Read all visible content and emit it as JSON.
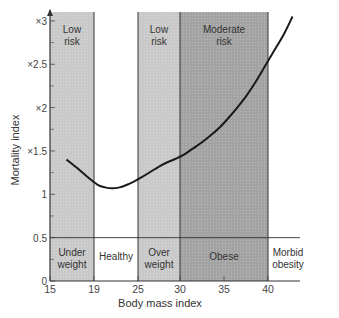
{
  "chart_data": {
    "type": "line",
    "title": "",
    "xlabel": "Body mass index",
    "ylabel": "Mortality index",
    "xlim": [
      15,
      43
    ],
    "ylim": [
      0,
      3.1
    ],
    "x_ticks": [
      15,
      19,
      25,
      30,
      35,
      40
    ],
    "y_ticks": [
      {
        "value": 0,
        "label": "0"
      },
      {
        "value": 0.5,
        "label": "0.5"
      },
      {
        "value": 1,
        "label": "1"
      },
      {
        "value": 1.5,
        "label": "×1.5"
      },
      {
        "value": 2,
        "label": "×2"
      },
      {
        "value": 2.5,
        "label": "×2.5"
      },
      {
        "value": 3,
        "label": "×3"
      }
    ],
    "grid": false,
    "series": [
      {
        "name": "Mortality index",
        "x": [
          16.5,
          17.5,
          18.5,
          19.5,
          20.5,
          21.5,
          22.5,
          23.5,
          24.5,
          25.5,
          26.5,
          27.5,
          28.5,
          29.5,
          30.5,
          31.5,
          32.5,
          33.5,
          34.5,
          35.5,
          36.5,
          37.5,
          38.5,
          39.5,
          40.5,
          41.5,
          42.3
        ],
        "values": [
          1.4,
          1.3,
          1.19,
          1.11,
          1.08,
          1.07,
          1.08,
          1.11,
          1.15,
          1.2,
          1.26,
          1.32,
          1.37,
          1.41,
          1.46,
          1.53,
          1.6,
          1.68,
          1.77,
          1.88,
          2.0,
          2.13,
          2.28,
          2.45,
          2.64,
          2.85,
          3.05
        ]
      }
    ],
    "bands": [
      {
        "from": 15,
        "to": 19,
        "label": "Under weight",
        "risk": "Low risk",
        "shade": "light"
      },
      {
        "from": 19,
        "to": 25,
        "label": "Healthy",
        "risk": "",
        "shade": "none"
      },
      {
        "from": 25,
        "to": 30,
        "label": "Over weight",
        "risk": "Low risk",
        "shade": "light"
      },
      {
        "from": 30,
        "to": 40,
        "label": "Obese",
        "risk": "Moderate risk",
        "shade": "dark"
      },
      {
        "from": 40,
        "to": 43,
        "label": "Morbid obesity",
        "risk": "",
        "shade": "none"
      }
    ],
    "reference_line": {
      "y": 0.5
    },
    "colors": {
      "light_band": "#c9c9c9",
      "dark_band": "#a3a3a3",
      "curve": "#1a1a1a",
      "axis": "#333333"
    }
  },
  "labels": {
    "xlabel": "Body mass index",
    "ylabel": "Mortality index",
    "risk_low_1": [
      "Low",
      "risk"
    ],
    "risk_low_2": [
      "Low",
      "risk"
    ],
    "risk_moderate": [
      "Moderate",
      "risk"
    ],
    "cat_under": [
      "Under",
      "weight"
    ],
    "cat_healthy": "Healthy",
    "cat_over": [
      "Over",
      "weight"
    ],
    "cat_obese": "Obese",
    "cat_morbid": [
      "Morbid",
      "obesity"
    ]
  }
}
